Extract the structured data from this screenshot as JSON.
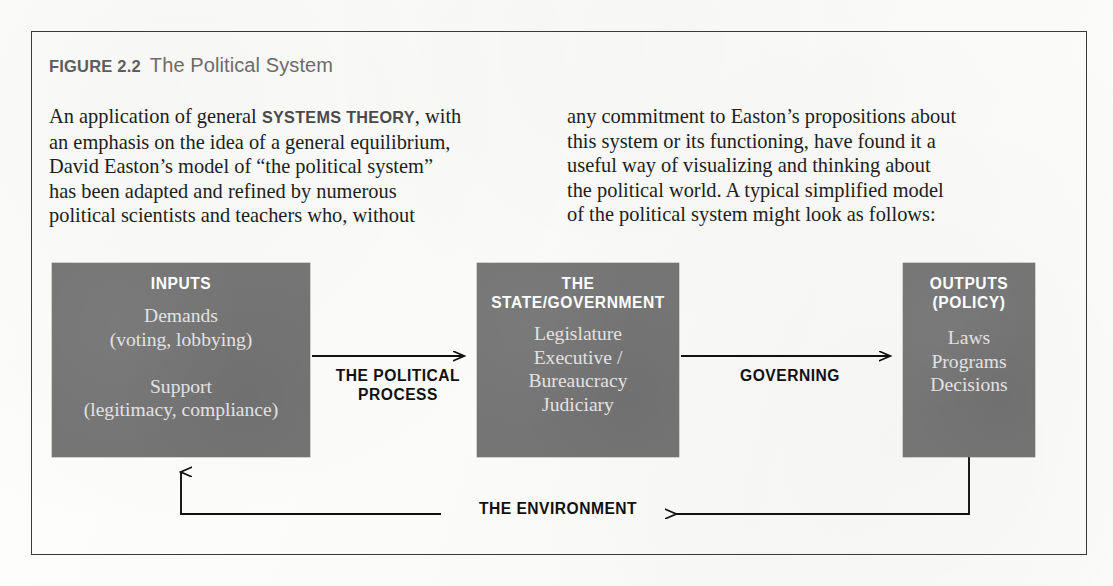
{
  "figure": {
    "label": "FIGURE 2.2",
    "title": "The Political System"
  },
  "body": {
    "left_part1": "An application of general ",
    "left_keyword": "SYSTEMS THEORY",
    "left_part2": ", with\nan emphasis on the idea of a general equilibrium,\nDavid Easton’s model of “the political system”\nhas been adapted and refined by numerous\npolitical scientists and teachers who, without",
    "right": "any commitment to Easton’s propositions about\nthis system or its functioning, have found it a\nuseful way of visualizing and thinking about\nthe political world. A typical simplified model\nof the political system might look as follows:"
  },
  "diagram": {
    "boxes": [
      {
        "id": "inputs",
        "heading": "INPUTS",
        "body": "Demands\n(voting, lobbying)\n\nSupport\n(legitimacy, compliance)"
      },
      {
        "id": "state",
        "heading": "THE STATE/GOVERNMENT",
        "body": "Legislature\nExecutive /\nBureaucracy\nJudiciary"
      },
      {
        "id": "outputs",
        "heading": "OUTPUTS\n(POLICY)",
        "body": "Laws\nPrograms\nDecisions"
      }
    ],
    "arrow_labels": {
      "process": "THE POLITICAL\nPROCESS",
      "governing": "GOVERNING",
      "environment": "THE ENVIRONMENT"
    }
  },
  "colors": {
    "box_fill": "#757575",
    "frame_border": "#3a3a3a",
    "caption_label": "#5d5d5d",
    "caption_title": "#6b6b6b",
    "body_text": "#201e1d",
    "keyword": "#4a4a4a",
    "box_heading": "#ffffff",
    "box_body": "#e2e2e2",
    "arrow": "#111111",
    "page_bg": "#fbfbf9"
  }
}
